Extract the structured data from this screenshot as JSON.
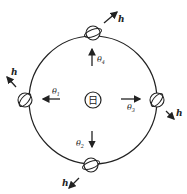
{
  "diagram": {
    "type": "orbit-diagram",
    "sun": {
      "label": "日",
      "cx": 93,
      "cy": 100,
      "r": 8
    },
    "orbit": {
      "cx": 93,
      "cy": 100,
      "r": 64,
      "stroke": "#222222"
    },
    "axis_label": "h",
    "positions": [
      {
        "id": "top",
        "theta_label": "θ",
        "theta_sub": "4",
        "planet": [
          93,
          33
        ]
      },
      {
        "id": "left",
        "theta_label": "θ",
        "theta_sub": "1",
        "planet": [
          25,
          100
        ]
      },
      {
        "id": "right",
        "theta_label": "θ",
        "theta_sub": "3",
        "planet": [
          157,
          100
        ]
      },
      {
        "id": "bottom",
        "theta_label": "θ",
        "theta_sub": "2",
        "planet": [
          91,
          165
        ]
      }
    ]
  }
}
